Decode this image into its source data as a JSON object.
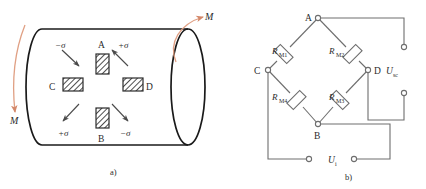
{
  "figure": {
    "panels": [
      {
        "id": "a",
        "caption": "a)",
        "caption_x": 110,
        "caption_y": 172
      },
      {
        "id": "b",
        "caption": "b)",
        "caption_x": 345,
        "caption_y": 178
      }
    ]
  },
  "shaft": {
    "name": "torsion-shaft",
    "torque_left_label": "M",
    "torque_right_label": "M",
    "torque_arrow_color": "#e8a583",
    "outline_color": "#1a1a1a",
    "gauges": [
      {
        "id": "A",
        "label": "A",
        "orientation": "vertical",
        "x": 96,
        "y": 54,
        "w": 13,
        "h": 20,
        "label_x": 99,
        "label_y": 42
      },
      {
        "id": "B",
        "label": "B",
        "orientation": "vertical",
        "x": 96,
        "y": 108,
        "w": 13,
        "h": 20,
        "label_x": 99,
        "label_y": 142
      },
      {
        "id": "C",
        "label": "C",
        "orientation": "horizontal",
        "x": 63,
        "y": 78,
        "w": 20,
        "h": 13,
        "label_x": 50,
        "label_y": 89
      },
      {
        "id": "D",
        "label": "D",
        "orientation": "horizontal",
        "x": 123,
        "y": 78,
        "w": 20,
        "h": 13,
        "label_x": 146,
        "label_y": 89
      }
    ],
    "stress_labels": [
      {
        "sign": "−σ",
        "x": 57,
        "y": 46,
        "quadrant": "top-left"
      },
      {
        "sign": "+σ",
        "x": 120,
        "y": 46,
        "quadrant": "top-right"
      },
      {
        "sign": "+σ",
        "x": 60,
        "y": 134,
        "quadrant": "bottom-left"
      },
      {
        "sign": "−σ",
        "x": 122,
        "y": 134,
        "quadrant": "bottom-right"
      }
    ]
  },
  "bridge": {
    "name": "wheatstone-bridge",
    "nodes": [
      {
        "id": "A",
        "label": "A",
        "x": 318,
        "y": 18,
        "label_x": 307,
        "label_y": 15
      },
      {
        "id": "C",
        "label": "C",
        "x": 268,
        "y": 70,
        "label_x": 256,
        "label_y": 73
      },
      {
        "id": "D",
        "label": "D",
        "x": 368,
        "y": 70,
        "label_x": 374,
        "label_y": 73
      },
      {
        "id": "B",
        "label": "B",
        "x": 318,
        "y": 124,
        "label_x": 314,
        "label_y": 139
      }
    ],
    "resistors": [
      {
        "id": "RM1",
        "label": "R",
        "sub": "M1",
        "between": [
          "A",
          "C"
        ],
        "label_x": 283,
        "label_y": 50
      },
      {
        "id": "RM2",
        "label": "R",
        "sub": "M2",
        "between": [
          "A",
          "D"
        ],
        "label_x": 340,
        "label_y": 50
      },
      {
        "id": "RM3",
        "label": "R",
        "sub": "M3",
        "between": [
          "D",
          "B"
        ],
        "label_x": 340,
        "label_y": 100
      },
      {
        "id": "RM4",
        "label": "R",
        "sub": "M4",
        "between": [
          "C",
          "B"
        ],
        "label_x": 283,
        "label_y": 100
      }
    ],
    "output": {
      "label": "U",
      "sub": "sc",
      "label_x": 392,
      "label_y": 73
    },
    "input": {
      "label": "U",
      "sub": "i",
      "label_x": 334,
      "label_y": 163
    },
    "terminals": [
      {
        "id": "usc-top",
        "x": 404,
        "y": 48
      },
      {
        "id": "usc-bottom",
        "x": 404,
        "y": 92
      },
      {
        "id": "ui-left",
        "x": 310,
        "y": 159
      },
      {
        "id": "ui-right",
        "x": 353,
        "y": 159
      }
    ],
    "wire_color": "#6e6e6e"
  }
}
